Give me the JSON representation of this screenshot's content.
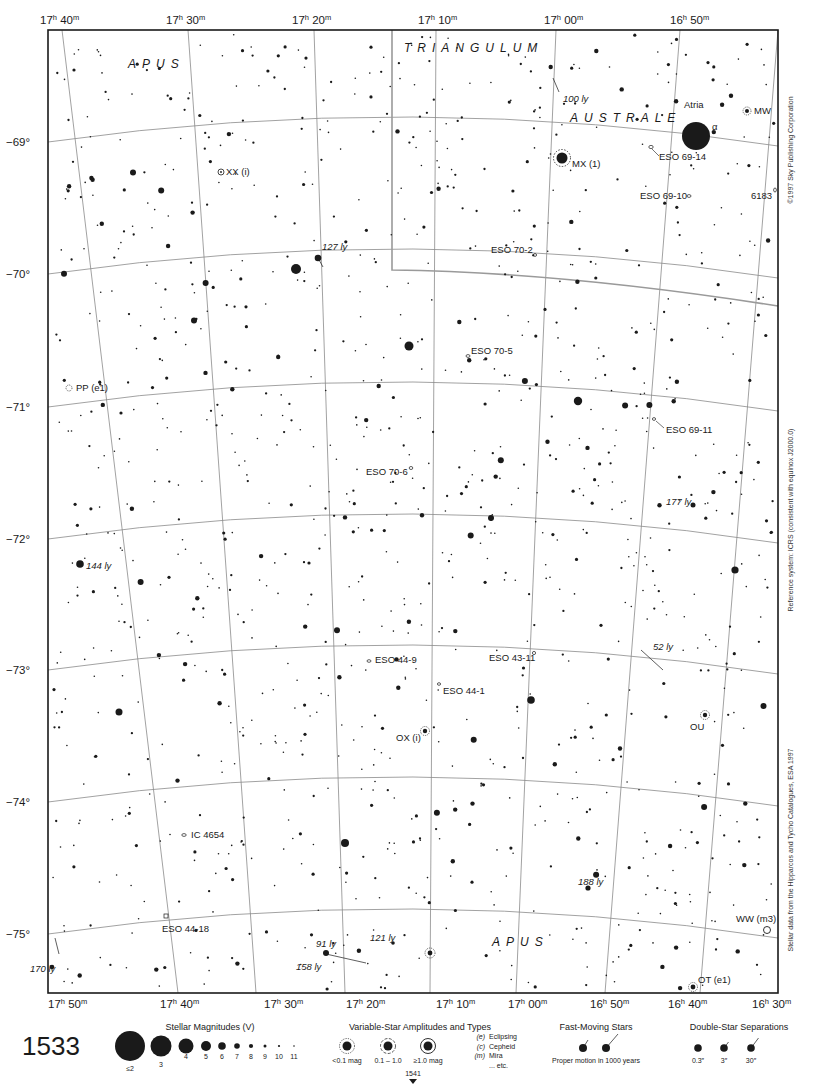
{
  "chart_page": {
    "page_number": "1533",
    "adjacent_page_south": "1541",
    "constellations": [
      {
        "name": "APUS",
        "x": 128,
        "y": 68
      },
      {
        "name": "TRIANGULUM",
        "x": 404,
        "y": 52
      },
      {
        "name": "AUSTRALE",
        "x": 570,
        "y": 122
      },
      {
        "name": "APUS",
        "x": 492,
        "y": 946
      }
    ],
    "ra_labels_top": [
      {
        "text": "17",
        "min": "40",
        "x": 40
      },
      {
        "text": "17",
        "min": "30",
        "x": 166
      },
      {
        "text": "17",
        "min": "20",
        "x": 292
      },
      {
        "text": "17",
        "min": "10",
        "x": 418
      },
      {
        "text": "17",
        "min": "00",
        "x": 544
      },
      {
        "text": "16",
        "min": "50",
        "x": 670
      }
    ],
    "ra_labels_bottom": [
      {
        "text": "17",
        "min": "50",
        "x": 46
      },
      {
        "text": "17",
        "min": "40",
        "x": 101
      },
      {
        "text": "17",
        "min": "30",
        "x": 156
      },
      {
        "text": "17",
        "min": "20",
        "x": 211
      },
      {
        "text": "17",
        "min": "10",
        "x": 266
      },
      {
        "text": "17",
        "min": "00",
        "x": 320
      },
      {
        "text": "16",
        "min": "50",
        "x": 374
      },
      {
        "text": "16",
        "min": "40",
        "x": 427
      },
      {
        "text": "16",
        "min": "30",
        "x": 483
      }
    ],
    "dec_labels": [
      {
        "text": "−69°",
        "y": 146
      },
      {
        "text": "−70°",
        "y": 278
      },
      {
        "text": "−71°",
        "y": 411
      },
      {
        "text": "−72°",
        "y": 543
      },
      {
        "text": "−73°",
        "y": 674
      },
      {
        "text": "−74°",
        "y": 806
      },
      {
        "text": "−75°",
        "y": 938
      }
    ],
    "objects": [
      {
        "label": "Atria",
        "x": 684,
        "y": 108,
        "type": "star-name"
      },
      {
        "label": "α",
        "x": 712,
        "y": 130,
        "type": "bayer"
      },
      {
        "label": "MW",
        "x": 754,
        "y": 114,
        "type": "variable"
      },
      {
        "label": "ESO 69-14",
        "x": 659,
        "y": 160,
        "type": "cluster"
      },
      {
        "label": "MX (1)",
        "x": 572,
        "y": 167,
        "type": "variable"
      },
      {
        "label": "ESO 69-10",
        "x": 640,
        "y": 199,
        "type": "cluster"
      },
      {
        "label": "6183",
        "x": 751,
        "y": 199,
        "type": "galaxy"
      },
      {
        "label": "XX (i)",
        "x": 226,
        "y": 175,
        "type": "variable"
      },
      {
        "label": "ESO 70-2",
        "x": 491,
        "y": 253,
        "type": "cluster"
      },
      {
        "label": "ESO 70-5",
        "x": 471,
        "y": 354,
        "type": "cluster"
      },
      {
        "label": "PP (e1)",
        "x": 76,
        "y": 391,
        "type": "variable"
      },
      {
        "label": "ESO 69-11",
        "x": 666,
        "y": 433,
        "type": "cluster"
      },
      {
        "label": "ESO 70-6",
        "x": 366,
        "y": 475,
        "type": "cluster"
      },
      {
        "label": "ESO 44-9",
        "x": 375,
        "y": 663,
        "type": "cluster"
      },
      {
        "label": "ESO 43-11",
        "x": 489,
        "y": 661,
        "type": "cluster"
      },
      {
        "label": "ESO 44-1",
        "x": 443,
        "y": 694,
        "type": "cluster"
      },
      {
        "label": "OX (i)",
        "x": 396,
        "y": 741,
        "type": "variable"
      },
      {
        "label": "OU",
        "x": 690,
        "y": 730,
        "type": "variable"
      },
      {
        "label": "IC 4654",
        "x": 191,
        "y": 838,
        "type": "cluster"
      },
      {
        "label": "ESO 44-18",
        "x": 162,
        "y": 932,
        "type": "cluster"
      },
      {
        "label": "WW (m3)",
        "x": 736,
        "y": 922,
        "type": "variable"
      },
      {
        "label": "OT (e1)",
        "x": 698,
        "y": 983,
        "type": "variable"
      }
    ],
    "distances": [
      {
        "label": "100 ly",
        "x": 563,
        "y": 102
      },
      {
        "label": "127 ly",
        "x": 322,
        "y": 250
      },
      {
        "label": "177 ly",
        "x": 666,
        "y": 505
      },
      {
        "label": "144 ly",
        "x": 86,
        "y": 569
      },
      {
        "label": "52 ly",
        "x": 653,
        "y": 650
      },
      {
        "label": "188 ly",
        "x": 578,
        "y": 885
      },
      {
        "label": "91 ly",
        "x": 316,
        "y": 947
      },
      {
        "label": "121 ly",
        "x": 370,
        "y": 941
      },
      {
        "label": "158 ly",
        "x": 296,
        "y": 970
      },
      {
        "label": "170 ly",
        "x": 30,
        "y": 972
      }
    ],
    "side_texts": {
      "copyright": "©1997 Sky Publishing Corporation",
      "reference": "Reference system: ICRS (consistent with equinox J2000.0)",
      "data_source": "Stellar data from the Hipparcos and Tycho Catalogues, ESA 1997"
    }
  },
  "legend": {
    "magnitudes": {
      "title": "Stellar Magnitudes (V)",
      "items": [
        "≤2",
        "3",
        "4",
        "5",
        "6",
        "7",
        "8",
        "9",
        "10",
        "11"
      ]
    },
    "variables": {
      "title": "Variable-Star Amplitudes and Types",
      "amplitudes": [
        "<0.1 mag",
        "0.1 – 1.0",
        "≥1.0 mag"
      ],
      "types": [
        {
          "code": "(e)",
          "name": "Eclipsing"
        },
        {
          "code": "(c)",
          "name": "Cepheid"
        },
        {
          "code": "(m)",
          "name": "Mira"
        },
        {
          "code": "",
          "name": "... etc."
        }
      ]
    },
    "fast_moving": {
      "title": "Fast-Moving Stars",
      "caption": "Proper motion in 1000 years"
    },
    "doubles": {
      "title": "Double-Star Separations",
      "items": [
        "0.3″",
        "3″",
        "30″"
      ]
    }
  },
  "colors": {
    "ink": "#1a1a1a",
    "grid": "#8a8a8a",
    "boundary": "#9a9a9a",
    "paper": "#ffffff"
  },
  "stars_seed": 1533
}
